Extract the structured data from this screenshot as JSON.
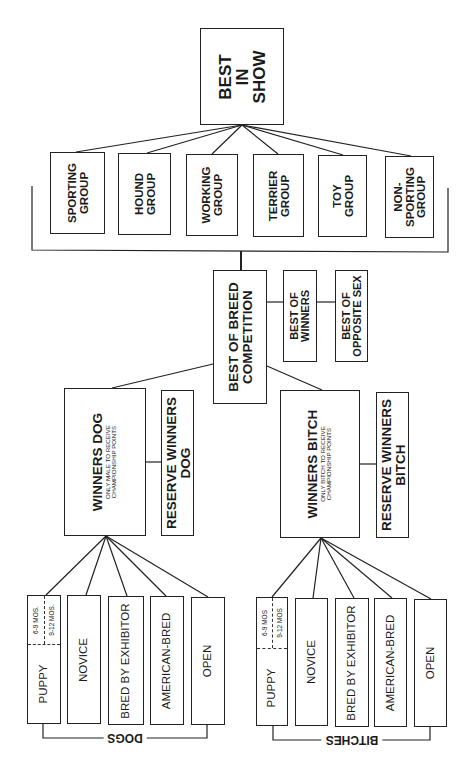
{
  "diagram": {
    "top": {
      "label": "BEST IN SHOW",
      "lines": [
        "BEST",
        "IN",
        "SHOW"
      ]
    },
    "groups": [
      {
        "id": "sporting",
        "lines": [
          "SPORTING",
          "GROUP"
        ]
      },
      {
        "id": "hound",
        "lines": [
          "HOUND",
          "GROUP"
        ]
      },
      {
        "id": "working",
        "lines": [
          "WORKING",
          "GROUP"
        ]
      },
      {
        "id": "terrier",
        "lines": [
          "TERRIER",
          "GROUP"
        ]
      },
      {
        "id": "toy",
        "lines": [
          "TOY",
          "GROUP"
        ]
      },
      {
        "id": "non-sporting",
        "lines": [
          "NON-",
          "SPORTING",
          "GROUP"
        ]
      }
    ],
    "breed": {
      "best_of_breed": {
        "lines": [
          "BEST OF BREED",
          "COMPETITION"
        ]
      },
      "best_of_winners": {
        "lines": [
          "BEST OF",
          "WINNERS"
        ]
      },
      "best_of_opposite_sex": {
        "lines": [
          "BEST OF",
          "OPPOSITE SEX"
        ]
      }
    },
    "winners_dog": {
      "title": "WINNERS DOG",
      "note_lines": [
        "ONLY MALE TO RECEIVE",
        "CHAMPIONSHIP POINTS"
      ],
      "reserve_lines": [
        "RESERVE WINNERS",
        "DOG"
      ]
    },
    "winners_bitch": {
      "title": "WINNERS BITCH",
      "note_lines": [
        "ONLY BITCH TO RECEIVE",
        "CHAMPIONSHIP POINTS"
      ],
      "reserve_lines": [
        "RESERVE WINNERS",
        "BITCH"
      ]
    },
    "dogs": {
      "bracket_label": "DOGS",
      "classes": [
        {
          "label": "PUPPY",
          "sub": [
            "6-9 MOS.",
            "9-12 MOS."
          ]
        },
        {
          "label": "NOVICE"
        },
        {
          "label": "BRED BY EXHIBITOR"
        },
        {
          "label": "AMERICAN-BRED"
        },
        {
          "label": "OPEN"
        }
      ]
    },
    "bitches": {
      "bracket_label": "BITCHES",
      "classes": [
        {
          "label": "PUPPY",
          "sub": [
            "6-9 MOS",
            "9-12 MOS"
          ]
        },
        {
          "label": "NOVICE"
        },
        {
          "label": "BRED BY EXHIBITOR"
        },
        {
          "label": "AMERICAN-BRED"
        },
        {
          "label": "OPEN"
        }
      ]
    }
  }
}
